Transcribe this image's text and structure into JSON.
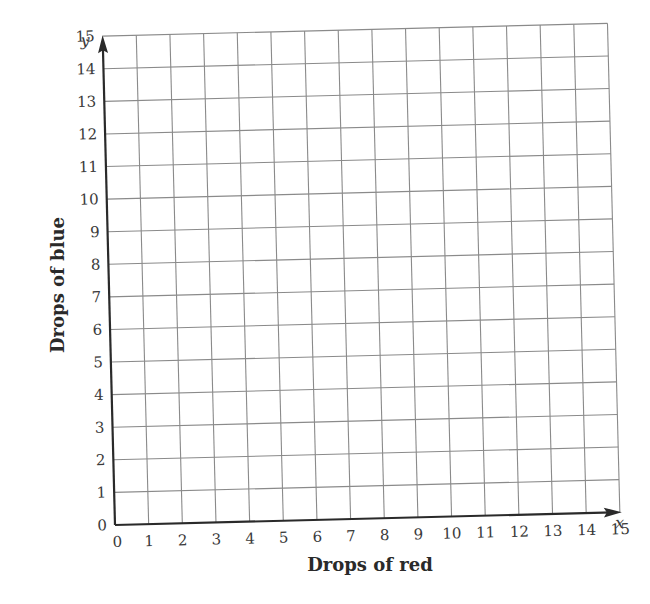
{
  "chart_data": {
    "type": "scatter",
    "title": "",
    "xlabel": "Drops of red",
    "ylabel": "Drops of blue",
    "x_axis_variable": "x",
    "y_axis_variable": "y",
    "xlim": [
      0,
      15
    ],
    "ylim": [
      0,
      15
    ],
    "x_ticks": [
      "0",
      "1",
      "2",
      "3",
      "4",
      "5",
      "6",
      "7",
      "8",
      "9",
      "10",
      "11",
      "12",
      "13",
      "14",
      "15"
    ],
    "y_ticks": [
      "0",
      "1",
      "2",
      "3",
      "4",
      "5",
      "6",
      "7",
      "8",
      "9",
      "10",
      "11",
      "12",
      "13",
      "14",
      "15"
    ],
    "grid": true,
    "series": [],
    "legend": null
  },
  "colors": {
    "grid": "#8a8a8a",
    "axis": "#2a2a2a",
    "text": "#3a3a3a",
    "background": "#ffffff"
  }
}
